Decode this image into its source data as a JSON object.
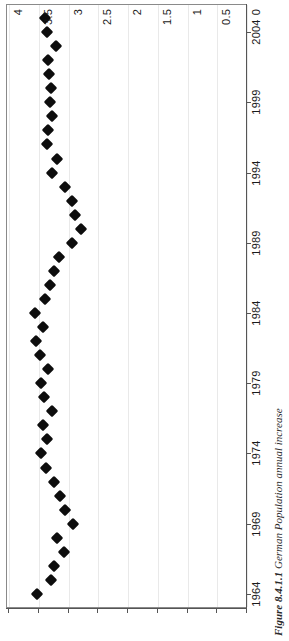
{
  "figure": {
    "caption_label": "Figure 8.4.1.1",
    "caption_text": "German Population annual increase"
  },
  "chart_data": {
    "type": "scatter",
    "title": "German Population annual increase",
    "orientation": "rotated-90",
    "xlabel": "",
    "ylabel": "",
    "grid": true,
    "legend": "none",
    "value_axis": {
      "name": "annual increase",
      "ticks": [
        "4",
        "3.5",
        "3",
        "2.5",
        "2",
        "1.5",
        "1",
        "0.5",
        "0"
      ],
      "tick_values": [
        4,
        3.5,
        3,
        2.5,
        2,
        1.5,
        1,
        0.5,
        0
      ],
      "range": [
        4,
        0
      ],
      "reversed": true
    },
    "year_axis": {
      "name": "year",
      "ticks": [
        "1964",
        "1969",
        "1974",
        "1979",
        "1984",
        "1989",
        "1994",
        "1999",
        "2004"
      ],
      "tick_values": [
        1964,
        1969,
        1974,
        1979,
        1984,
        1989,
        1994,
        1999,
        2004
      ],
      "range": [
        1963,
        2006
      ]
    },
    "categories": [
      1964,
      1965,
      1966,
      1967,
      1968,
      1969,
      1970,
      1971,
      1972,
      1973,
      1974,
      1975,
      1976,
      1977,
      1978,
      1979,
      1980,
      1981,
      1982,
      1983,
      1984,
      1985,
      1986,
      1987,
      1988,
      1989,
      1990,
      1991,
      1992,
      1993,
      1994,
      1995,
      1996,
      1997,
      1998,
      1999,
      2000,
      2001,
      2002,
      2003,
      2004,
      2005
    ],
    "values": [
      3.52,
      3.27,
      3.22,
      3.06,
      3.18,
      2.91,
      3.04,
      3.12,
      3.23,
      3.36,
      3.44,
      3.35,
      3.42,
      3.26,
      3.39,
      3.45,
      3.33,
      3.47,
      3.53,
      3.41,
      3.54,
      3.38,
      3.29,
      3.22,
      3.14,
      2.93,
      2.78,
      2.87,
      2.93,
      3.05,
      3.26,
      3.17,
      3.34,
      3.32,
      3.26,
      3.3,
      3.28,
      3.31,
      3.33,
      3.19,
      3.35,
      3.37
    ],
    "series": [
      {
        "name": "German Population annual increase",
        "marker": "filled-diamond",
        "color": "#0d0d0d",
        "points": [
          {
            "year": 1964,
            "value": 3.52
          },
          {
            "year": 1965,
            "value": 3.27
          },
          {
            "year": 1966,
            "value": 3.22
          },
          {
            "year": 1967,
            "value": 3.06
          },
          {
            "year": 1968,
            "value": 3.18
          },
          {
            "year": 1969,
            "value": 2.91
          },
          {
            "year": 1970,
            "value": 3.04
          },
          {
            "year": 1971,
            "value": 3.12
          },
          {
            "year": 1972,
            "value": 3.23
          },
          {
            "year": 1973,
            "value": 3.36
          },
          {
            "year": 1974,
            "value": 3.44
          },
          {
            "year": 1975,
            "value": 3.35
          },
          {
            "year": 1976,
            "value": 3.42
          },
          {
            "year": 1977,
            "value": 3.26
          },
          {
            "year": 1978,
            "value": 3.39
          },
          {
            "year": 1979,
            "value": 3.45
          },
          {
            "year": 1980,
            "value": 3.33
          },
          {
            "year": 1981,
            "value": 3.47
          },
          {
            "year": 1982,
            "value": 3.53
          },
          {
            "year": 1983,
            "value": 3.41
          },
          {
            "year": 1984,
            "value": 3.54
          },
          {
            "year": 1985,
            "value": 3.38
          },
          {
            "year": 1986,
            "value": 3.29
          },
          {
            "year": 1987,
            "value": 3.22
          },
          {
            "year": 1988,
            "value": 3.14
          },
          {
            "year": 1989,
            "value": 2.93
          },
          {
            "year": 1990,
            "value": 2.78
          },
          {
            "year": 1991,
            "value": 2.87
          },
          {
            "year": 1992,
            "value": 2.93
          },
          {
            "year": 1993,
            "value": 3.05
          },
          {
            "year": 1994,
            "value": 3.26
          },
          {
            "year": 1995,
            "value": 3.17
          },
          {
            "year": 1996,
            "value": 3.34
          },
          {
            "year": 1997,
            "value": 3.32
          },
          {
            "year": 1998,
            "value": 3.26
          },
          {
            "year": 1999,
            "value": 3.3
          },
          {
            "year": 2000,
            "value": 3.28
          },
          {
            "year": 2001,
            "value": 3.31
          },
          {
            "year": 2002,
            "value": 3.33
          },
          {
            "year": 2003,
            "value": 3.19
          },
          {
            "year": 2004,
            "value": 3.35
          },
          {
            "year": 2005,
            "value": 3.37
          }
        ]
      }
    ]
  },
  "colors": {
    "marker": "#0d0d0d",
    "axis": "#555555",
    "grid": "#e9e9e9",
    "frame": "#8a8a8a",
    "background": "#ffffff"
  }
}
